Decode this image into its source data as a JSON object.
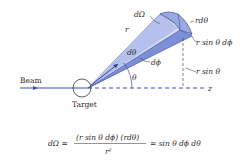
{
  "colors": {
    "beam": "#3a4fb0",
    "cone_light": "#cdd6f2",
    "cone_mid": "#8f9fdc",
    "cone_dark": "#5a6cc4",
    "outline": "#2a3a8c",
    "text": "#2a2a2a"
  },
  "labels": {
    "beam": "Beam",
    "target": "Target",
    "z_axis": "z",
    "theta": "θ",
    "r": "r",
    "d_omega": "dΩ",
    "d_theta": "dθ",
    "d_phi": "dϕ",
    "r_d_theta": "rdθ",
    "r_sin_theta_d_phi": "r sin θ dϕ",
    "r_sin_theta": "r sin θ"
  },
  "formula": {
    "lhs": "dΩ =",
    "numerator": "(r sin θ dϕ) (rdθ)",
    "denominator": "r²",
    "rhs": "= sin θ dϕ dθ"
  }
}
